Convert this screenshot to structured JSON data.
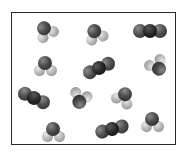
{
  "diagram": {
    "border_color": "#2a2a2a",
    "colors": {
      "oxygen": "#4a4a4a",
      "hydrogen": "#b5b5b5",
      "carbon": "#1a1a1a"
    },
    "molecules": [
      {
        "type": "H2O",
        "x": 45,
        "y": 30,
        "rotation": -30
      },
      {
        "type": "H2O",
        "x": 95,
        "y": 33,
        "rotation": -20
      },
      {
        "type": "CO2",
        "x": 150,
        "y": 31,
        "rotation": 0
      },
      {
        "type": "H2O",
        "x": 45,
        "y": 65,
        "rotation": 0
      },
      {
        "type": "CO2",
        "x": 99,
        "y": 68,
        "rotation": -25
      },
      {
        "type": "H2O",
        "x": 158,
        "y": 67,
        "rotation": 150
      },
      {
        "type": "CO2",
        "x": 34,
        "y": 98,
        "rotation": 25
      },
      {
        "type": "H2O",
        "x": 80,
        "y": 100,
        "rotation": 200
      },
      {
        "type": "H2O",
        "x": 124,
        "y": 96,
        "rotation": 30
      },
      {
        "type": "H2O",
        "x": 53,
        "y": 131,
        "rotation": 0
      },
      {
        "type": "CO2",
        "x": 112,
        "y": 129,
        "rotation": -15
      },
      {
        "type": "H2O",
        "x": 152,
        "y": 121,
        "rotation": 0
      }
    ],
    "counts": {
      "H2O": 8,
      "CO2": 4
    }
  }
}
